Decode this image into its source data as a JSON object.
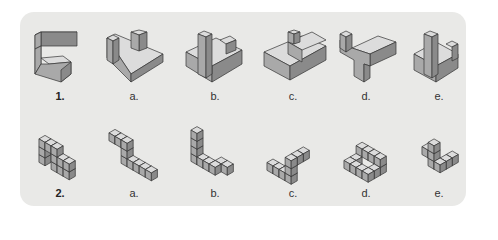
{
  "figure": {
    "rows": [
      {
        "question_label": "1.",
        "figure_type": "solid-block",
        "options": [
          "a.",
          "b.",
          "c.",
          "d.",
          "e."
        ]
      },
      {
        "question_label": "2.",
        "figure_type": "unit-cubes",
        "options": [
          "a.",
          "b.",
          "c.",
          "d.",
          "e."
        ]
      }
    ]
  }
}
